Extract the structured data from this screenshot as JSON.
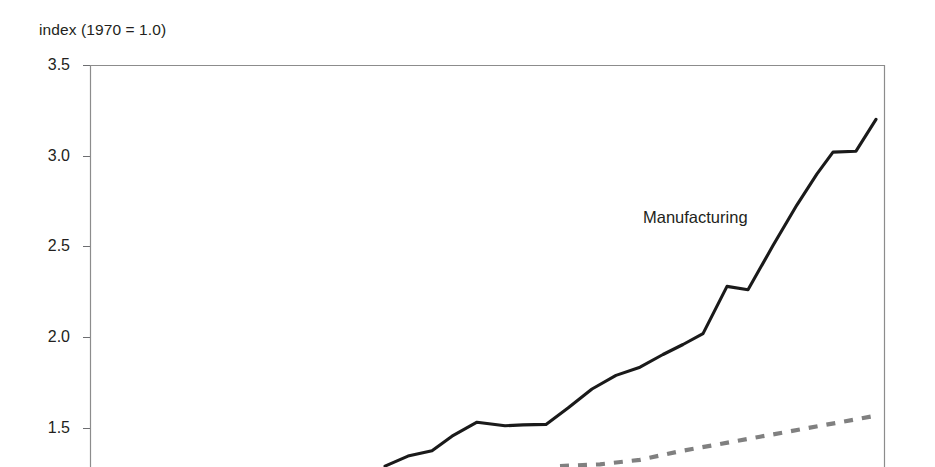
{
  "chart_data": {
    "type": "line",
    "title": "",
    "ylabel": "index (1970 = 1.0)",
    "xlabel": "",
    "ylim": [
      1.29,
      3.5
    ],
    "yticks": [
      3.5,
      3.0,
      2.5,
      2.0,
      1.5
    ],
    "ytick_labels": [
      "3.5",
      "3.0",
      "2.5",
      "2.0",
      "1.5"
    ],
    "grid": false,
    "legend_position": "inline-annotation",
    "note": "x-axis labels and lower portion of plot are cropped out of the visible screenshot",
    "annotations": [
      {
        "text": "Manufacturing",
        "x_px": 643,
        "y_px": 223
      }
    ],
    "series": [
      {
        "name": "Manufacturing",
        "style": "solid",
        "color": "#1a1a1a",
        "points": [
          {
            "x_px": 385,
            "value": 1.29
          },
          {
            "x_px": 408,
            "value": 1.345
          },
          {
            "x_px": 432,
            "value": 1.375
          },
          {
            "x_px": 452,
            "value": 1.455
          },
          {
            "x_px": 477,
            "value": 1.532
          },
          {
            "x_px": 505,
            "value": 1.512
          },
          {
            "x_px": 523,
            "value": 1.517
          },
          {
            "x_px": 546,
            "value": 1.52
          },
          {
            "x_px": 568,
            "value": 1.61
          },
          {
            "x_px": 592,
            "value": 1.715
          },
          {
            "x_px": 616,
            "value": 1.79
          },
          {
            "x_px": 640,
            "value": 1.835
          },
          {
            "x_px": 663,
            "value": 1.905
          },
          {
            "x_px": 683,
            "value": 1.96
          },
          {
            "x_px": 703,
            "value": 2.02
          },
          {
            "x_px": 727,
            "value": 2.28
          },
          {
            "x_px": 748,
            "value": 2.262
          },
          {
            "x_px": 773,
            "value": 2.505
          },
          {
            "x_px": 797,
            "value": 2.73
          },
          {
            "x_px": 817,
            "value": 2.9
          },
          {
            "x_px": 833,
            "value": 3.02
          },
          {
            "x_px": 856,
            "value": 3.025
          },
          {
            "x_px": 876,
            "value": 3.2
          }
        ]
      },
      {
        "name": "unlabeled-dashed-series",
        "style": "dashed",
        "color": "#808080",
        "points": [
          {
            "x_px": 560,
            "value": 1.29
          },
          {
            "x_px": 600,
            "value": 1.3
          },
          {
            "x_px": 640,
            "value": 1.325
          },
          {
            "x_px": 680,
            "value": 1.372
          },
          {
            "x_px": 720,
            "value": 1.412
          },
          {
            "x_px": 760,
            "value": 1.452
          },
          {
            "x_px": 800,
            "value": 1.492
          },
          {
            "x_px": 840,
            "value": 1.532
          },
          {
            "x_px": 878,
            "value": 1.57
          }
        ]
      }
    ]
  },
  "axis": {
    "frame": {
      "left_px": 90,
      "right_px": 885,
      "top_px": 65
    },
    "frame_color": "#8c8c8c"
  }
}
